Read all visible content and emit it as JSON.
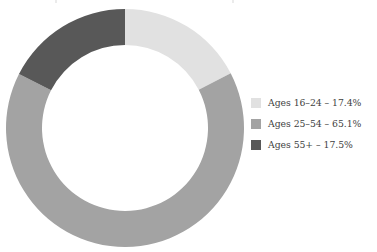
{
  "chart_data": {
    "type": "pie",
    "variant": "donut",
    "title": "",
    "subtitle": "",
    "xlabel": "",
    "ylabel": "",
    "grid": false,
    "legend_position": "right",
    "start_angle_deg": 0,
    "direction": "clockwise",
    "center": {
      "x": 125,
      "y": 128
    },
    "outer_radius": 119,
    "inner_radius": 83,
    "categories": [
      "Ages 16–24",
      "Ages 25–54",
      "Ages 55+"
    ],
    "values": [
      17.4,
      65.1,
      17.5
    ],
    "value_unit": "%",
    "slices": [
      {
        "category": "Ages 16–24",
        "value": 17.4,
        "value_text": "17.4%",
        "angle_deg": 62.6,
        "color": "#e1e1e1",
        "legend_text": "Ages 16–24 – 17.4%"
      },
      {
        "category": "Ages 25–54",
        "value": 65.1,
        "value_text": "65.1%",
        "angle_deg": 234.4,
        "color": "#a3a3a3",
        "legend_text": "Ages 25–54 – 65.1%"
      },
      {
        "category": "Ages 55+",
        "value": 17.5,
        "value_text": "17.5%",
        "angle_deg": 63.0,
        "color": "#585858",
        "legend_text": "Ages 55+ – 17.5%"
      }
    ]
  },
  "legend": {
    "items": [
      {
        "label": "Ages 16–24 – 17.4%",
        "color": "#e1e1e1"
      },
      {
        "label": "Ages 25–54 – 65.1%",
        "color": "#a3a3a3"
      },
      {
        "label": "Ages 55+ – 17.5%",
        "color": "#585858"
      }
    ]
  },
  "colors": {
    "background": "#ffffff",
    "text": "#3f3f3f",
    "slice_light": "#e1e1e1",
    "slice_medium": "#a3a3a3",
    "slice_dark": "#585858"
  }
}
